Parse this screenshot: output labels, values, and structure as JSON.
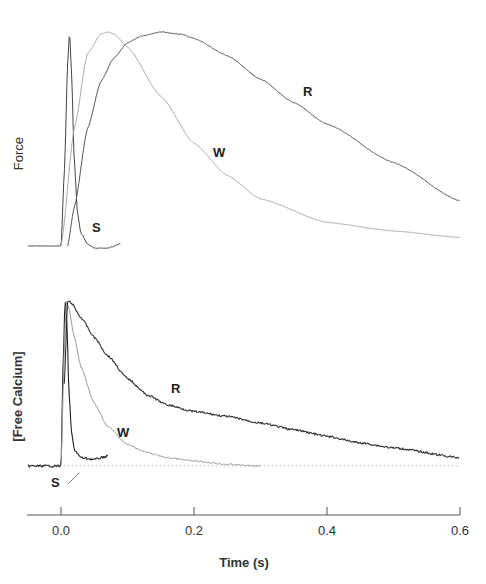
{
  "chart_data": [
    {
      "type": "line",
      "panel": "top",
      "title": "",
      "ylabel": "Force",
      "xlabel": "Time (s)",
      "xlim": [
        -0.05,
        0.6
      ],
      "ylim": [
        0,
        1
      ],
      "y_units": "normalized (peak = 1)",
      "grid": false,
      "legend": "inline labels",
      "series": [
        {
          "name": "S",
          "color": "#444444",
          "x": [
            -0.05,
            0.0,
            0.005,
            0.01,
            0.013,
            0.016,
            0.02,
            0.025,
            0.03,
            0.04,
            0.05,
            0.07,
            0.09
          ],
          "values": [
            0.0,
            0.0,
            0.35,
            0.85,
            1.0,
            0.8,
            0.4,
            0.15,
            0.06,
            0.01,
            -0.01,
            -0.01,
            0.01
          ]
        },
        {
          "name": "W",
          "color": "#aaaaaa",
          "x": [
            0.0,
            0.02,
            0.04,
            0.06,
            0.07,
            0.08,
            0.1,
            0.15,
            0.2,
            0.25,
            0.3,
            0.4,
            0.5,
            0.6
          ],
          "values": [
            0.0,
            0.55,
            0.9,
            0.99,
            1.0,
            0.99,
            0.93,
            0.7,
            0.48,
            0.33,
            0.22,
            0.11,
            0.07,
            0.04
          ]
        },
        {
          "name": "R",
          "color": "#555555",
          "x": [
            0.01,
            0.02,
            0.04,
            0.06,
            0.08,
            0.1,
            0.12,
            0.15,
            0.18,
            0.2,
            0.25,
            0.3,
            0.35,
            0.4,
            0.5,
            0.6
          ],
          "values": [
            0.0,
            0.18,
            0.55,
            0.77,
            0.88,
            0.95,
            0.98,
            1.0,
            0.99,
            0.97,
            0.89,
            0.78,
            0.67,
            0.57,
            0.39,
            0.21
          ]
        }
      ],
      "annotations": [
        {
          "text": "S",
          "x": 0.053,
          "y": 0.09
        },
        {
          "text": "W",
          "x": 0.236,
          "y": 0.42
        },
        {
          "text": "R",
          "x": 0.372,
          "y": 0.7
        }
      ]
    },
    {
      "type": "line",
      "panel": "bottom",
      "title": "",
      "ylabel": "[Free Calcium]",
      "xlabel": "Time (s)",
      "xlim": [
        -0.05,
        0.6
      ],
      "ylim": [
        0,
        1
      ],
      "y_units": "normalized (peak = 1)",
      "grid": false,
      "legend": "inline labels",
      "baseline": {
        "style": "dotted",
        "y": 0
      },
      "series": [
        {
          "name": "S",
          "color": "#222222",
          "x": [
            -0.05,
            0.0,
            0.003,
            0.006,
            0.009,
            0.012,
            0.016,
            0.02,
            0.03,
            0.05,
            0.07
          ],
          "values": [
            0.0,
            0.0,
            0.6,
            1.0,
            0.85,
            0.45,
            0.2,
            0.1,
            0.05,
            0.04,
            0.06
          ]
        },
        {
          "name": "W",
          "color": "#999999",
          "x": [
            0.0,
            0.005,
            0.008,
            0.012,
            0.02,
            0.03,
            0.05,
            0.07,
            0.1,
            0.13,
            0.16,
            0.2,
            0.25,
            0.3
          ],
          "values": [
            0.0,
            0.7,
            1.0,
            0.95,
            0.78,
            0.6,
            0.38,
            0.24,
            0.13,
            0.08,
            0.05,
            0.03,
            0.01,
            0.0
          ]
        },
        {
          "name": "R",
          "color": "#333333",
          "x": [
            0.005,
            0.01,
            0.015,
            0.03,
            0.05,
            0.07,
            0.1,
            0.13,
            0.16,
            0.2,
            0.25,
            0.3,
            0.35,
            0.4,
            0.45,
            0.5,
            0.6
          ],
          "values": [
            0.5,
            1.0,
            0.99,
            0.9,
            0.78,
            0.67,
            0.53,
            0.43,
            0.37,
            0.33,
            0.3,
            0.26,
            0.22,
            0.18,
            0.14,
            0.11,
            0.05
          ]
        }
      ],
      "annotations": [
        {
          "text": "S",
          "x": -0.007,
          "y": -0.1
        },
        {
          "text": "W",
          "x": 0.094,
          "y": 0.15
        },
        {
          "text": "R",
          "x": 0.172,
          "y": 0.45
        }
      ]
    }
  ],
  "labels": {
    "force_ylabel": "Force",
    "calcium_ylabel": "[Free Calcium]",
    "xlabel": "Time (s)",
    "x_ticks": [
      "0.0",
      "0.2",
      "0.4",
      "0.6"
    ],
    "top_S": "S",
    "top_W": "W",
    "top_R": "R",
    "bottom_S": "S",
    "bottom_W": "W",
    "bottom_R": "R"
  }
}
